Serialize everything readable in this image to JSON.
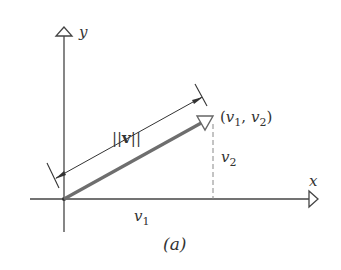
{
  "figure": {
    "caption": "(a)",
    "axes": {
      "x_label": "x",
      "y_label": "y"
    },
    "vector": {
      "norm_label": "||v||",
      "norm_bars": "||",
      "norm_symbol": "v",
      "endpoint_label": "(v₁, v₂)",
      "endpoint_open": "(",
      "endpoint_v1": "v",
      "endpoint_sub1": "1",
      "endpoint_sep": ", ",
      "endpoint_v2": "v",
      "endpoint_sub2": "2",
      "endpoint_close": ")",
      "x_component_label": "v₁",
      "x_component_var": "v",
      "x_component_sub": "1",
      "y_component_label": "v₂",
      "y_component_var": "v",
      "y_component_sub": "2"
    },
    "colors": {
      "axis": "#444444",
      "vector": "#6e6e6e",
      "dashed": "#888888",
      "text": "#333333"
    }
  }
}
